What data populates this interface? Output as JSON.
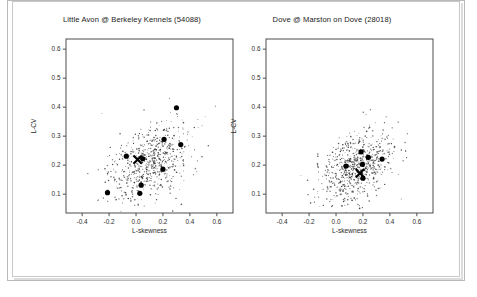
{
  "page": {
    "background_color": "#ffffff",
    "frame_color": "#b9b9b9"
  },
  "chart_data": [
    {
      "type": "scatter",
      "title": "Little Avon @ Berkeley Kennels (54088)",
      "xlabel": "L-skewness",
      "ylabel": "L-CV",
      "xlim": [
        -0.52,
        0.72
      ],
      "ylim": [
        0.035,
        0.635
      ],
      "xticks": [
        -0.4,
        -0.2,
        0.0,
        0.2,
        0.4,
        0.6
      ],
      "xticklabels": [
        "-0.4",
        "-0.2",
        "0.0",
        "0.2",
        "0.4",
        "0.6"
      ],
      "yticks": [
        0.1,
        0.2,
        0.3,
        0.4,
        0.5,
        0.6
      ],
      "yticklabels": [
        "0.1",
        "0.2",
        "0.3",
        "0.4",
        "0.5",
        "0.6"
      ],
      "grid": false,
      "legend": "none",
      "series": [
        {
          "name": "simulated-sample-points",
          "marker": "small-dot",
          "color": "#3a3a3a",
          "count": 640,
          "cloud": {
            "cx": 0.1,
            "cy": 0.205,
            "sx": 0.155,
            "sy": 0.068,
            "rho": 0.42,
            "seed": 17
          }
        },
        {
          "name": "site-l-moment-points",
          "marker": "large-dot",
          "color": "#000000",
          "points": [
            {
              "x": 0.3,
              "y": 0.398
            },
            {
              "x": 0.208,
              "y": 0.289
            },
            {
              "x": 0.332,
              "y": 0.271
            },
            {
              "x": -0.072,
              "y": 0.231
            },
            {
              "x": 0.05,
              "y": 0.222
            },
            {
              "x": 0.2,
              "y": 0.186
            },
            {
              "x": 0.038,
              "y": 0.131
            },
            {
              "x": -0.212,
              "y": 0.105
            },
            {
              "x": 0.028,
              "y": 0.103
            }
          ]
        },
        {
          "name": "regional-average",
          "marker": "x-cross",
          "color": "#000000",
          "points": [
            {
              "x": 0.012,
              "y": 0.219
            }
          ]
        }
      ]
    },
    {
      "type": "scatter",
      "title": "Dove @ Marston on Dove (28018)",
      "xlabel": "L-skewness",
      "ylabel": "L-CV",
      "xlim": [
        -0.52,
        0.72
      ],
      "ylim": [
        0.035,
        0.635
      ],
      "xticks": [
        -0.4,
        -0.2,
        0.0,
        0.2,
        0.4,
        0.6
      ],
      "xticklabels": [
        "-0.4",
        "-0.2",
        "0.0",
        "0.2",
        "0.4",
        "0.6"
      ],
      "yticks": [
        0.1,
        0.2,
        0.3,
        0.4,
        0.5,
        0.6
      ],
      "yticklabels": [
        "0.1",
        "0.2",
        "0.3",
        "0.4",
        "0.5",
        "0.6"
      ],
      "grid": false,
      "legend": "none",
      "series": [
        {
          "name": "simulated-sample-points",
          "marker": "small-dot",
          "color": "#3a3a3a",
          "count": 700,
          "cloud": {
            "cx": 0.155,
            "cy": 0.195,
            "sx": 0.135,
            "sy": 0.06,
            "rho": 0.4,
            "seed": 53
          }
        },
        {
          "name": "site-l-moment-points",
          "marker": "large-dot",
          "color": "#000000",
          "points": [
            {
              "x": 0.186,
              "y": 0.246
            },
            {
              "x": 0.24,
              "y": 0.227
            },
            {
              "x": 0.342,
              "y": 0.221
            },
            {
              "x": 0.196,
              "y": 0.203
            },
            {
              "x": 0.074,
              "y": 0.197
            },
            {
              "x": 0.2,
              "y": 0.155
            }
          ]
        },
        {
          "name": "regional-average",
          "marker": "x-cross",
          "color": "#000000",
          "points": [
            {
              "x": 0.178,
              "y": 0.172
            }
          ]
        }
      ]
    }
  ]
}
